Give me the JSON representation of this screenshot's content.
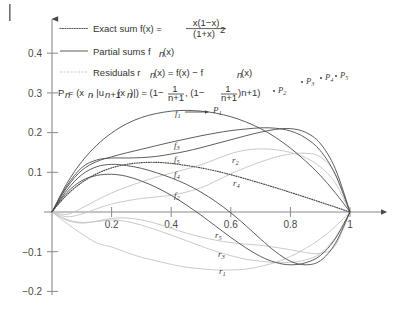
{
  "figure": {
    "caption_margin_mark": "",
    "background": "#ffffff"
  },
  "legend": {
    "entries": [
      {
        "style": "dotted",
        "label": "Exact sum f(x) =",
        "frac_num": "x(1−x)",
        "frac_den": "(1+x)",
        "frac_den_exp": "2"
      },
      {
        "style": "solid",
        "label": "Partial sums f",
        "sub": "n",
        "label_tail": "(x)"
      },
      {
        "style": "dashed",
        "label": "Residuals r",
        "sub": "n",
        "label_tail": "(x) = f(x) − f",
        "sub2": "n",
        "label_tail2": "(x)"
      }
    ],
    "formula": {
      "lead": "P",
      "lead_sub": "n",
      "eq1": " = (x",
      "eq1_sub": "n",
      "eq2": ", |u",
      "eq2_sub": "n+1",
      "eq3": "(x",
      "eq3_sub": "n",
      "eq4": ")|) = (1−",
      "frac1_num": "1",
      "frac1_den": "n+1",
      "eq5": ",  (1−",
      "frac2_num": "1",
      "frac2_den": "n+1",
      "eq6": ")n+1)"
    }
  },
  "axes": {
    "x_ticks": [
      "0.2",
      "0.4",
      "0.6",
      "0.8",
      "1"
    ],
    "x_tick_values": [
      0.2,
      0.4,
      0.6,
      0.8,
      1.0
    ],
    "y_ticks": [
      "0.4",
      "0.3",
      "0.2",
      "0.1",
      "−0.1",
      "−0.2"
    ],
    "y_tick_values": [
      0.4,
      0.3,
      0.2,
      0.1,
      -0.1,
      -0.2
    ],
    "xlim": [
      -0.04,
      1.12
    ],
    "ylim": [
      -0.24,
      0.47
    ],
    "grid": false,
    "x_axis_arrow": true,
    "y_axis_arrow": true
  },
  "curve_labels": [
    {
      "text": "f",
      "sub": "1",
      "x": 175,
      "y": 116
    },
    {
      "text": "P",
      "sub": "1",
      "x": 213,
      "y": 113
    },
    {
      "text": "f",
      "sub": "3",
      "x": 174,
      "y": 148
    },
    {
      "text": "f",
      "sub": "5",
      "x": 174,
      "y": 162
    },
    {
      "text": "f",
      "sub": "4",
      "x": 174,
      "y": 177
    },
    {
      "text": "f",
      "sub": "2",
      "x": 174,
      "y": 198
    },
    {
      "text": "r",
      "sub": "2",
      "x": 232,
      "y": 163
    },
    {
      "text": "r",
      "sub": "4",
      "x": 233,
      "y": 186
    },
    {
      "text": "r",
      "sub": "5",
      "x": 215,
      "y": 238
    },
    {
      "text": "r",
      "sub": "3",
      "x": 218,
      "y": 257
    },
    {
      "text": "r",
      "sub": "1",
      "x": 219,
      "y": 274
    }
  ],
  "point_labels": [
    {
      "text": "P",
      "sub": "2",
      "x": 278,
      "y": 93
    },
    {
      "text": "P",
      "sub": "3",
      "x": 306,
      "y": 84
    },
    {
      "text": "P",
      "sub": "4",
      "x": 325,
      "y": 80
    },
    {
      "text": "P",
      "sub": "5",
      "x": 340,
      "y": 78
    }
  ],
  "chart_data": {
    "type": "line",
    "title": "",
    "xlabel": "",
    "ylabel": "",
    "xlim": [
      0,
      1.12
    ],
    "ylim": [
      -0.22,
      0.45
    ],
    "x_ticks": [
      0.2,
      0.4,
      0.6,
      0.8,
      1.0
    ],
    "y_ticks": [
      -0.2,
      -0.1,
      0.1,
      0.2,
      0.3,
      0.4
    ],
    "grid": false,
    "legend_position": "top-left",
    "series": [
      {
        "name": "Exact sum f(x) = x(1-x)/(1+x)^2",
        "style": "dotted",
        "color": "#4a4a4a",
        "x": [
          0,
          0.02,
          0.05,
          0.08,
          0.12,
          0.16,
          0.2,
          0.25,
          0.3,
          0.35,
          0.4,
          0.45,
          0.5,
          0.55,
          0.6,
          0.65,
          0.7,
          0.75,
          0.8,
          0.85,
          0.9,
          0.95,
          1.0
        ],
        "y": [
          0,
          0.0188,
          0.0431,
          0.0631,
          0.0841,
          0.0999,
          0.1111,
          0.12,
          0.1243,
          0.1251,
          0.1224,
          0.1173,
          0.1111,
          0.1033,
          0.0938,
          0.0835,
          0.0726,
          0.0612,
          0.0494,
          0.0373,
          0.0249,
          0.0125,
          0
        ]
      },
      {
        "name": "f1",
        "style": "solid",
        "color": "#4c4c4c",
        "x": [
          0,
          0.05,
          0.1,
          0.15,
          0.2,
          0.25,
          0.3,
          0.35,
          0.4,
          0.45,
          0.5,
          0.55,
          0.6,
          0.65,
          0.7,
          0.75,
          0.8,
          0.85,
          0.9,
          0.95,
          1.0
        ],
        "y": [
          0,
          0.072,
          0.127,
          0.168,
          0.199,
          0.222,
          0.238,
          0.248,
          0.254,
          0.256,
          0.254,
          0.249,
          0.24,
          0.227,
          0.21,
          0.188,
          0.161,
          0.129,
          0.0925,
          0.049,
          0
        ]
      },
      {
        "name": "f2",
        "style": "solid",
        "color": "#4c4c4c",
        "x": [
          0,
          0.05,
          0.1,
          0.15,
          0.2,
          0.25,
          0.3,
          0.35,
          0.4,
          0.45,
          0.5,
          0.55,
          0.6,
          0.65,
          0.7,
          0.75,
          0.8,
          0.85,
          0.9,
          0.95,
          1.0
        ],
        "y": [
          0,
          0.049,
          0.079,
          0.092,
          0.095,
          0.09,
          0.078,
          0.062,
          0.042,
          0.018,
          -0.008,
          -0.036,
          -0.064,
          -0.09,
          -0.112,
          -0.127,
          -0.133,
          -0.128,
          -0.11,
          -0.068,
          0
        ]
      },
      {
        "name": "f3",
        "style": "solid",
        "color": "#4c4c4c",
        "x": [
          0,
          0.05,
          0.1,
          0.15,
          0.2,
          0.25,
          0.3,
          0.35,
          0.4,
          0.45,
          0.5,
          0.55,
          0.6,
          0.65,
          0.7,
          0.75,
          0.8,
          0.85,
          0.9,
          0.95,
          1.0
        ],
        "y": [
          0,
          0.062,
          0.105,
          0.127,
          0.139,
          0.149,
          0.158,
          0.167,
          0.176,
          0.184,
          0.192,
          0.199,
          0.205,
          0.209,
          0.212,
          0.211,
          0.204,
          0.187,
          0.155,
          0.0955,
          0
        ]
      },
      {
        "name": "f4",
        "style": "solid",
        "color": "#4c4c4c",
        "x": [
          0,
          0.05,
          0.1,
          0.15,
          0.2,
          0.25,
          0.3,
          0.35,
          0.4,
          0.45,
          0.5,
          0.55,
          0.6,
          0.65,
          0.7,
          0.75,
          0.8,
          0.85,
          0.9,
          0.95,
          1.0
        ],
        "y": [
          0,
          0.055,
          0.094,
          0.114,
          0.12,
          0.117,
          0.11,
          0.099,
          0.086,
          0.07,
          0.05,
          0.026,
          -0.002,
          -0.034,
          -0.068,
          -0.1,
          -0.124,
          -0.133,
          -0.123,
          -0.08,
          0
        ]
      },
      {
        "name": "f5",
        "style": "solid",
        "color": "#4c4c4c",
        "x": [
          0,
          0.05,
          0.1,
          0.15,
          0.2,
          0.25,
          0.3,
          0.35,
          0.4,
          0.45,
          0.5,
          0.55,
          0.6,
          0.65,
          0.7,
          0.75,
          0.8,
          0.85,
          0.9,
          0.95,
          1.0
        ],
        "y": [
          0,
          0.066,
          0.112,
          0.131,
          0.136,
          0.136,
          0.137,
          0.14,
          0.146,
          0.153,
          0.162,
          0.172,
          0.182,
          0.192,
          0.201,
          0.208,
          0.21,
          0.201,
          0.173,
          0.11,
          0
        ]
      },
      {
        "name": "r1",
        "style": "dashed",
        "color": "#c4c4c4",
        "x": [
          0,
          0.05,
          0.1,
          0.15,
          0.2,
          0.25,
          0.3,
          0.35,
          0.4,
          0.45,
          0.5,
          0.55,
          0.6,
          0.65,
          0.7,
          0.75,
          0.8,
          0.85,
          0.9,
          0.95,
          1.0
        ],
        "y": [
          0,
          -0.029,
          -0.055,
          -0.078,
          -0.088,
          -0.102,
          -0.114,
          -0.123,
          -0.132,
          -0.139,
          -0.143,
          -0.146,
          -0.146,
          -0.144,
          -0.137,
          -0.127,
          -0.112,
          -0.092,
          -0.068,
          -0.037,
          0
        ]
      },
      {
        "name": "r2",
        "style": "dashed",
        "color": "#c4c4c4",
        "x": [
          0,
          0.05,
          0.1,
          0.15,
          0.2,
          0.25,
          0.3,
          0.35,
          0.4,
          0.45,
          0.5,
          0.55,
          0.6,
          0.65,
          0.7,
          0.75,
          0.8,
          0.85,
          0.9,
          0.95,
          1.0
        ],
        "y": [
          0,
          -0.006,
          0.01,
          0.03,
          0.048,
          0.063,
          0.076,
          0.088,
          0.098,
          0.108,
          0.119,
          0.133,
          0.147,
          0.156,
          0.159,
          0.157,
          0.15,
          0.137,
          0.114,
          0.074,
          0
        ]
      },
      {
        "name": "r3",
        "style": "dashed",
        "color": "#c4c4c4",
        "x": [
          0,
          0.05,
          0.1,
          0.15,
          0.2,
          0.25,
          0.3,
          0.35,
          0.4,
          0.45,
          0.5,
          0.55,
          0.6,
          0.65,
          0.7,
          0.75,
          0.8,
          0.85,
          0.9,
          0.95,
          1.0
        ],
        "y": [
          0,
          -0.019,
          -0.026,
          -0.024,
          -0.02,
          -0.024,
          -0.033,
          -0.045,
          -0.058,
          -0.072,
          -0.086,
          -0.099,
          -0.11,
          -0.119,
          -0.124,
          -0.127,
          -0.127,
          -0.121,
          -0.105,
          -0.065,
          0
        ]
      },
      {
        "name": "r4",
        "style": "dashed",
        "color": "#c4c4c4",
        "x": [
          0,
          0.05,
          0.1,
          0.15,
          0.2,
          0.25,
          0.3,
          0.35,
          0.4,
          0.45,
          0.5,
          0.55,
          0.6,
          0.65,
          0.7,
          0.75,
          0.8,
          0.85,
          0.9,
          0.95,
          1.0
        ],
        "y": [
          0,
          -0.012,
          -0.005,
          0.008,
          0.02,
          0.028,
          0.034,
          0.038,
          0.042,
          0.05,
          0.061,
          0.078,
          0.096,
          0.112,
          0.126,
          0.138,
          0.146,
          0.148,
          0.139,
          0.097,
          0
        ]
      },
      {
        "name": "r5",
        "style": "dashed",
        "color": "#c4c4c4",
        "x": [
          0,
          0.05,
          0.1,
          0.15,
          0.2,
          0.25,
          0.3,
          0.35,
          0.4,
          0.45,
          0.5,
          0.55,
          0.6,
          0.65,
          0.7,
          0.75,
          0.8,
          0.85,
          0.9,
          0.95,
          1.0
        ],
        "y": [
          0,
          -0.021,
          -0.028,
          -0.023,
          -0.016,
          -0.015,
          -0.02,
          -0.029,
          -0.041,
          -0.053,
          -0.063,
          -0.071,
          -0.077,
          -0.081,
          -0.084,
          -0.089,
          -0.095,
          -0.102,
          -0.104,
          -0.085,
          0
        ]
      }
    ],
    "annotated_points": [
      {
        "label": "P1",
        "x_px": 213,
        "y_px": 113
      },
      {
        "label": "P2",
        "x_px": 278,
        "y_px": 93
      },
      {
        "label": "P3",
        "x_px": 306,
        "y_px": 84
      },
      {
        "label": "P4",
        "x_px": 325,
        "y_px": 80
      },
      {
        "label": "P5",
        "x_px": 340,
        "y_px": 78
      }
    ]
  }
}
